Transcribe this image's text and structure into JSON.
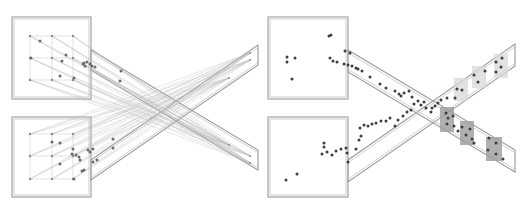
{
  "figure": {
    "panels": [
      {
        "id": "left",
        "rooms": [
          {
            "name": "top-room",
            "x": 12,
            "y": 17,
            "w": 79,
            "h": 82
          },
          {
            "name": "bottom-room",
            "x": 12,
            "y": 117,
            "w": 79,
            "h": 80
          }
        ],
        "corridors": [
          {
            "name": "corridor-down",
            "points": [
              [
                91,
                50
              ],
              [
                258,
                150
              ],
              [
                258,
                170
              ],
              [
                91,
                70
              ]
            ],
            "comment": "top room to bottom-right exit"
          },
          {
            "name": "corridor-up",
            "points": [
              [
                91,
                160
              ],
              [
                258,
                45
              ],
              [
                258,
                65
              ],
              [
                91,
                180
              ]
            ],
            "comment": "bottom room to top-right exit"
          }
        ],
        "grid_top": {
          "xs": [
            30,
            52,
            73
          ],
          "ys": [
            36,
            58,
            80
          ]
        },
        "grid_bottom": {
          "xs": [
            30,
            52,
            73
          ],
          "ys": [
            134,
            156,
            179
          ]
        },
        "exit_targets": [
          [
            250,
            53
          ],
          [
            250,
            60
          ],
          [
            250,
            156
          ],
          [
            250,
            163
          ],
          [
            229,
            78
          ],
          [
            229,
            145
          ]
        ],
        "agents": [
          [
            40,
            41
          ],
          [
            31,
            58
          ],
          [
            66,
            55
          ],
          [
            62,
            61
          ],
          [
            60,
            76
          ],
          [
            74,
            78
          ],
          [
            84,
            63
          ],
          [
            87,
            62
          ],
          [
            90,
            64
          ],
          [
            92,
            66
          ],
          [
            95,
            67
          ],
          [
            83,
            64
          ],
          [
            85,
            66
          ],
          [
            121,
            71
          ],
          [
            120,
            81
          ],
          [
            52,
            142
          ],
          [
            60,
            143
          ],
          [
            73,
            149
          ],
          [
            72,
            154
          ],
          [
            76,
            155
          ],
          [
            79,
            157
          ],
          [
            60,
            164
          ],
          [
            88,
            150
          ],
          [
            90,
            152
          ],
          [
            93,
            149
          ],
          [
            97,
            160
          ],
          [
            93,
            162
          ],
          [
            82,
            171
          ],
          [
            84,
            170
          ],
          [
            74,
            179
          ],
          [
            113,
            139
          ],
          [
            113,
            148
          ],
          [
            80,
            160
          ]
        ]
      },
      {
        "id": "right",
        "rooms": [
          {
            "name": "top-room",
            "x": 268,
            "y": 17,
            "w": 80,
            "h": 82
          },
          {
            "name": "bottom-room",
            "x": 268,
            "y": 117,
            "w": 80,
            "h": 80
          }
        ],
        "corridors": [
          {
            "name": "corridor-down",
            "points": [
              [
                348,
                50
              ],
              [
                515,
                150
              ],
              [
                515,
                172
              ],
              [
                348,
                72
              ]
            ]
          },
          {
            "name": "corridor-up",
            "points": [
              [
                348,
                160
              ],
              [
                515,
                44
              ],
              [
                515,
                66
              ],
              [
                348,
                182
              ]
            ]
          }
        ],
        "zones_light": [
          {
            "x": 454,
            "y": 78,
            "w": 14,
            "h": 23
          },
          {
            "x": 472,
            "y": 66,
            "w": 14,
            "h": 22
          },
          {
            "x": 494,
            "y": 54,
            "w": 14,
            "h": 24
          }
        ],
        "zones_dark": [
          {
            "x": 440,
            "y": 107,
            "w": 14,
            "h": 25
          },
          {
            "x": 460,
            "y": 121,
            "w": 14,
            "h": 24
          },
          {
            "x": 486,
            "y": 137,
            "w": 16,
            "h": 24
          }
        ],
        "agents": [
          [
            329,
            36
          ],
          [
            331,
            35
          ],
          [
            287,
            57
          ],
          [
            287,
            62
          ],
          [
            295,
            58
          ],
          [
            292,
            79
          ],
          [
            345,
            51
          ],
          [
            350,
            53
          ],
          [
            330,
            58
          ],
          [
            333,
            61
          ],
          [
            337,
            62
          ],
          [
            344,
            64
          ],
          [
            348,
            65
          ],
          [
            352,
            66
          ],
          [
            356,
            68
          ],
          [
            358,
            69
          ],
          [
            362,
            71
          ],
          [
            370,
            77
          ],
          [
            380,
            84
          ],
          [
            386,
            88
          ],
          [
            395,
            91
          ],
          [
            399,
            94
          ],
          [
            401,
            96
          ],
          [
            404,
            93
          ],
          [
            409,
            91
          ],
          [
            412,
            97
          ],
          [
            414,
            104
          ],
          [
            418,
            101
          ],
          [
            421,
            105
          ],
          [
            424,
            102
          ],
          [
            426,
            108
          ],
          [
            432,
            108
          ],
          [
            431,
            112
          ],
          [
            435,
            106
          ],
          [
            438,
            103
          ],
          [
            441,
            100
          ],
          [
            447,
            98
          ],
          [
            446,
            113
          ],
          [
            448,
            118
          ],
          [
            447,
            124
          ],
          [
            453,
            116
          ],
          [
            454,
            126
          ],
          [
            457,
            89
          ],
          [
            462,
            90
          ],
          [
            455,
            98
          ],
          [
            474,
            75
          ],
          [
            478,
            82
          ],
          [
            485,
            71
          ],
          [
            496,
            62
          ],
          [
            502,
            58
          ],
          [
            496,
            72
          ],
          [
            501,
            67
          ],
          [
            458,
            131
          ],
          [
            462,
            127
          ],
          [
            466,
            135
          ],
          [
            470,
            129
          ],
          [
            472,
            139
          ],
          [
            474,
            143
          ],
          [
            489,
            138
          ],
          [
            496,
            143
          ],
          [
            488,
            150
          ],
          [
            496,
            154
          ],
          [
            503,
            159
          ],
          [
            360,
            128
          ],
          [
            364,
            125
          ],
          [
            368,
            126
          ],
          [
            372,
            124
          ],
          [
            376,
            123
          ],
          [
            381,
            121
          ],
          [
            386,
            121
          ],
          [
            390,
            118
          ],
          [
            395,
            126
          ],
          [
            398,
            120
          ],
          [
            403,
            116
          ],
          [
            407,
            112
          ],
          [
            411,
            110
          ],
          [
            324,
            143
          ],
          [
            324,
            147
          ],
          [
            322,
            154
          ],
          [
            327,
            152
          ],
          [
            332,
            155
          ],
          [
            336,
            151
          ],
          [
            341,
            149
          ],
          [
            346,
            148
          ],
          [
            347,
            153
          ],
          [
            359,
            140
          ],
          [
            361,
            136
          ],
          [
            356,
            149
          ],
          [
            348,
            162
          ],
          [
            286,
            180
          ],
          [
            297,
            174
          ]
        ]
      }
    ]
  }
}
